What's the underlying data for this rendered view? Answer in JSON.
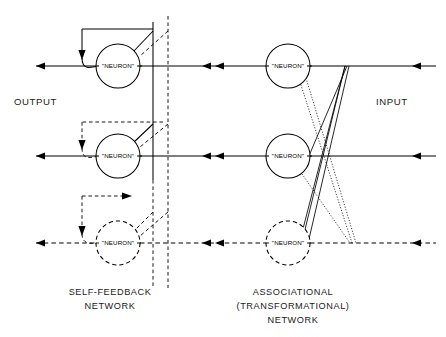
{
  "figure": {
    "background_color": "#ffffff",
    "line_color": "#000000",
    "width": 446,
    "height": 337
  },
  "labels": {
    "output": "OUTPUT",
    "input": "INPUT",
    "self_feedback_line1": "SELF-FEEDBACK",
    "self_feedback_line2": "NETWORK",
    "associational_line1": "ASSOCIATIONAL",
    "associational_line2": "(TRANSFORMATIONAL)",
    "associational_line3": "NETWORK"
  },
  "neurons": {
    "label": "\"NEURON\"",
    "left_column": [
      {
        "id": "left-top",
        "row": "top",
        "style": "solid",
        "cx": 118,
        "cy": 66,
        "r": 22
      },
      {
        "id": "left-middle",
        "row": "middle",
        "style": "solid",
        "cx": 118,
        "cy": 156,
        "r": 22
      },
      {
        "id": "left-bottom",
        "row": "bottom",
        "style": "dashed",
        "cx": 118,
        "cy": 243,
        "r": 22
      }
    ],
    "right_column": [
      {
        "id": "right-top",
        "row": "top",
        "style": "solid",
        "cx": 288,
        "cy": 66,
        "r": 22
      },
      {
        "id": "right-middle",
        "row": "middle",
        "style": "solid",
        "cx": 288,
        "cy": 156,
        "r": 22
      },
      {
        "id": "right-bottom",
        "row": "bottom",
        "style": "dashed",
        "cx": 288,
        "cy": 243,
        "r": 22
      }
    ]
  },
  "rows": [
    {
      "name": "top",
      "y": 66,
      "style": "solid"
    },
    {
      "name": "middle",
      "y": 156,
      "style": "solid"
    },
    {
      "name": "bottom",
      "y": 243,
      "style": "dashed"
    }
  ],
  "dividers": [
    {
      "id": "solid-divider",
      "x": 153,
      "style": "solid",
      "y_from": 22,
      "y_to": 180
    },
    {
      "id": "dashed-divider",
      "x": 168,
      "style": "dashed",
      "y_from": 16,
      "y_to": 288
    }
  ],
  "signal_flow": {
    "direction": "right-to-left",
    "arrowheads_per_row": 4
  }
}
